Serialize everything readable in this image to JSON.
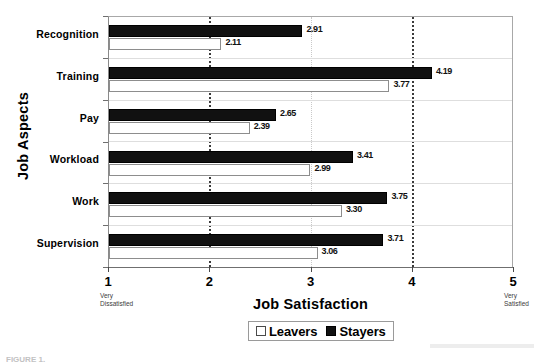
{
  "chart_data": {
    "type": "bar",
    "orientation": "horizontal",
    "title": "",
    "xlabel": "Job Satisfaction",
    "ylabel": "Job Aspects",
    "categories": [
      "Recognition",
      "Training",
      "Pay",
      "Workload",
      "Work",
      "Supervision"
    ],
    "series": [
      {
        "name": "Stayers",
        "color": "#111111",
        "values": [
          2.91,
          4.19,
          2.65,
          3.41,
          3.75,
          3.71
        ],
        "labels": [
          "2.91",
          "4.19",
          "2.65",
          "3.41",
          "3.75",
          "3.71"
        ]
      },
      {
        "name": "Leavers",
        "color": "#ffffff",
        "values": [
          2.11,
          3.77,
          2.39,
          2.99,
          3.3,
          3.06
        ],
        "labels": [
          "2.11",
          "3.77",
          "2.39",
          "2.99",
          "3.30",
          "3.06"
        ]
      }
    ],
    "xlim": [
      1,
      5
    ],
    "xticks": [
      1,
      2,
      3,
      4,
      5
    ],
    "xtick_labels": [
      "1",
      "2",
      "3",
      "4",
      "5"
    ],
    "x_anchor_low": "Very\nDissatisfied",
    "x_anchor_low_line1": "Very",
    "x_anchor_low_line2": "Dissatisfied",
    "x_anchor_high_line1": "Very",
    "x_anchor_high_line2": "Satisfied",
    "grid": "vertical dotted gridlines at 2, 3, 4",
    "gridlines": [
      2,
      3,
      4
    ],
    "legend_position": "bottom-center",
    "legend_entries": [
      "Leavers",
      "Stayers"
    ]
  },
  "axis": {
    "x_title": "Job Satisfaction",
    "y_title": "Job Aspects",
    "tick_labels": [
      "1",
      "2",
      "3",
      "4",
      "5"
    ],
    "low_anchor_1": "Very",
    "low_anchor_2": "Dissatisfied",
    "high_anchor_1": "Very",
    "high_anchor_2": "Satisfied"
  },
  "legend": {
    "leavers": "Leavers",
    "stayers": "Stayers"
  },
  "caption": {
    "text": "FIGURE 1."
  }
}
